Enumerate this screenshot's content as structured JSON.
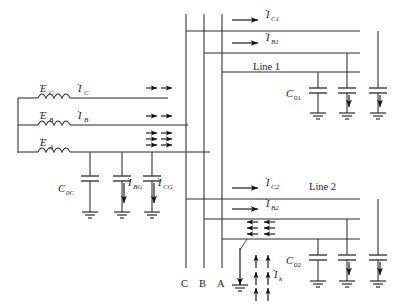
{
  "figure": {
    "type": "single-line-power-system-schematic"
  },
  "source": {
    "emf_labels": [
      "E",
      "E",
      "E"
    ],
    "emf_subscripts": [
      "C",
      "B",
      "A"
    ],
    "current_labels": [
      "I",
      "I"
    ],
    "current_subscripts": [
      "C",
      "B"
    ],
    "dot_symbol": "˙"
  },
  "source_caps": [
    {
      "label": "C",
      "subscript": "0C",
      "current_label": null,
      "current_subscript": null
    },
    {
      "label": null,
      "subscript": null,
      "current_label": "I",
      "current_subscript": "BG"
    },
    {
      "label": null,
      "subscript": null,
      "current_label": "I",
      "current_subscript": "CG"
    }
  ],
  "bus": {
    "labels": [
      "C",
      "B",
      "A"
    ]
  },
  "line1": {
    "name": "Line 1",
    "currents": [
      {
        "label": "I",
        "subscript": "C1"
      },
      {
        "label": "I",
        "subscript": "B1"
      }
    ],
    "cap_label": "C",
    "cap_subscript": "01"
  },
  "line2": {
    "name": "Line 2",
    "currents": [
      {
        "label": "I",
        "subscript": "C2"
      },
      {
        "label": "I",
        "subscript": "B2"
      }
    ],
    "cap_label": "C",
    "cap_subscript": "02",
    "fault_current_label": "I",
    "fault_current_subscript": "k"
  },
  "colors": {
    "wire": "#2b2b2b",
    "text": "#1a1a1a",
    "background": "#ffffff"
  }
}
